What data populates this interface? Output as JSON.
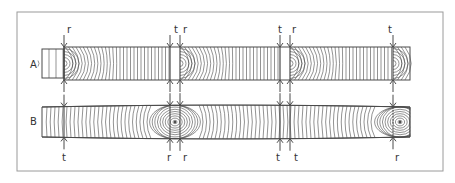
{
  "figure": {
    "frame": {
      "x": 17,
      "y": 12,
      "w": 426,
      "h": 159,
      "stroke": "#9a9a9a"
    },
    "line_color": "#4a4a4a",
    "strips": [
      {
        "label": "A",
        "label_pos": {
          "x": 30,
          "y": 68
        },
        "top": 47,
        "bottom": 80,
        "left_stub": {
          "x0": 42,
          "x1": 64
        },
        "right_end": 410,
        "joints": [
          {
            "x": 64,
            "top": "r",
            "bottom": "",
            "arc_dir": "right"
          },
          {
            "x": 170,
            "top": "t",
            "bottom": "",
            "arc_dir": "none"
          },
          {
            "x": 180,
            "top": "r",
            "bottom": "",
            "arc_dir": "right"
          },
          {
            "x": 280,
            "top": "t",
            "bottom": "",
            "arc_dir": "none"
          },
          {
            "x": 290,
            "top": "r",
            "bottom": "",
            "arc_dir": "right"
          },
          {
            "x": 393,
            "top": "t",
            "bottom": "",
            "arc_dir": "right"
          }
        ]
      },
      {
        "label": "B",
        "label_pos": {
          "x": 30,
          "y": 125
        },
        "top_left": 107,
        "bottom_left": 137,
        "top_mid": 105,
        "bottom_mid": 139,
        "left_end": 42,
        "right_end": 410,
        "joints": [
          {
            "x": 64,
            "top": "",
            "bottom": "t"
          },
          {
            "x": 170,
            "top": "",
            "bottom": "r"
          },
          {
            "x": 180,
            "top": "",
            "bottom": "r"
          },
          {
            "x": 280,
            "top": "",
            "bottom": "t"
          },
          {
            "x": 290,
            "top": "",
            "bottom": "t"
          },
          {
            "x": 393,
            "top": "",
            "bottom": "r"
          }
        ],
        "pith_centers": [
          175,
          400
        ]
      }
    ],
    "labels_top_A": [
      {
        "text": "r",
        "x": 67
      },
      {
        "text": "t",
        "x": 174
      },
      {
        "text": "r",
        "x": 183
      },
      {
        "text": "t",
        "x": 278
      },
      {
        "text": "r",
        "x": 292
      },
      {
        "text": "t",
        "x": 388
      }
    ],
    "labels_bottom_B": [
      {
        "text": "t",
        "x": 62
      },
      {
        "text": "r",
        "x": 167
      },
      {
        "text": "r",
        "x": 183
      },
      {
        "text": "t",
        "x": 276
      },
      {
        "text": "t",
        "x": 294
      },
      {
        "text": "r",
        "x": 395
      }
    ]
  }
}
